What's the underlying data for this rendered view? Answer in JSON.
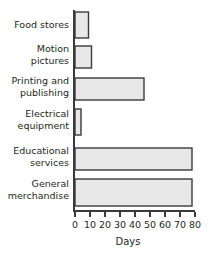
{
  "chart_data": {
    "type": "bar",
    "orientation": "horizontal",
    "title": "",
    "xlabel": "Days",
    "ylabel": "",
    "categories": [
      "Food stores",
      "Motion pictures",
      "Printing and publishing",
      "Electrical equipment",
      "Educational services",
      "General merchandise"
    ],
    "values": [
      20,
      9,
      11,
      46,
      4,
      78
    ],
    "xlim": [
      0,
      80
    ],
    "xticks": [
      0,
      10,
      20,
      30,
      40,
      50,
      60,
      70,
      80
    ],
    "xtick_labels": [
      "0",
      "10",
      "20",
      "30",
      "40",
      "50",
      "60",
      "70",
      "80"
    ],
    "grid": false,
    "legend": false,
    "bar_fill_color": "#e8e8e8",
    "bar_edge_color": "#3a3a3a",
    "axis_color": "#3a3a3a"
  },
  "labels": {
    "cat_0_line_0": "Food stores",
    "cat_1_line_0": "Motion",
    "cat_1_line_1": "pictures",
    "cat_2_line_0": "Printing and",
    "cat_2_line_1": "publishing",
    "cat_3_line_0": "Electrical",
    "cat_3_line_1": "equipment",
    "cat_4_line_0": "Educational",
    "cat_4_line_1": "services",
    "cat_5_line_0": "General",
    "cat_5_line_1": "merchandise"
  },
  "ticks": {
    "t0": "0",
    "t1": "10",
    "t2": "20",
    "t3": "30",
    "t4": "40",
    "t5": "50",
    "t6": "60",
    "t7": "70",
    "t8": "80"
  },
  "axis": {
    "x_title": "Days"
  }
}
